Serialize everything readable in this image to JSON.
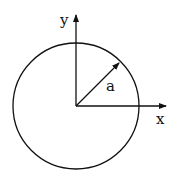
{
  "diagram": {
    "type": "circle-with-axes",
    "labels": {
      "y_axis": "y",
      "x_axis": "x",
      "radius": "a"
    },
    "colors": {
      "stroke": "#111111",
      "background": "#ffffff"
    }
  }
}
